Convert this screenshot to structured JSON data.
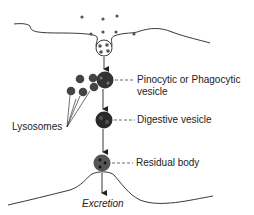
{
  "diagram": {
    "title": "",
    "labels": {
      "pinocytic": "Pinocytic or Phagocytic",
      "pinocytic_line2": "vesicle",
      "digestive": "Digestive vesicle",
      "residual": "Residual body",
      "lysosomes": "Lysosomes",
      "excretion": "Excretion"
    },
    "colors": {
      "line": "#222222",
      "particle": "#555555",
      "vesicle_fill": "#3a3a3a",
      "lysosome_fill": "#444444"
    }
  }
}
